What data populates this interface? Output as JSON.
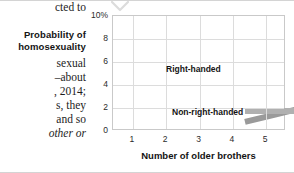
{
  "page": {
    "body_column_lines": [
      {
        "text": "cted  to",
        "top": 1,
        "style": "serif"
      },
      {
        "text": "sexual",
        "top": 57,
        "style": "serif"
      },
      {
        "text": "–about",
        "top": 71,
        "style": "serif"
      },
      {
        "text": ", 2014;",
        "top": 85,
        "style": "serif"
      },
      {
        "text": "s, they",
        "top": 99,
        "style": "serif"
      },
      {
        "text": "and so",
        "top": 113,
        "style": "serif"
      },
      {
        "text": "other or",
        "top": 127,
        "style": "serif-italic"
      }
    ],
    "caption": {
      "line1": "Probability of",
      "line1_top": 29,
      "line2": "homosexuality",
      "line2_top": 41
    },
    "ornament": {
      "icon": "chevron-down-icon",
      "color": "#d9d9d9"
    }
  },
  "chart_data": {
    "type": "line",
    "title": "",
    "subtitle": "",
    "xlabel": "Number of older brothers",
    "ylabel": "Probability of homosexuality",
    "x": [
      1,
      2,
      3,
      4,
      5
    ],
    "xticklabels": [
      "1",
      "2",
      "3",
      "4",
      "5"
    ],
    "yticklabels": [
      "10%",
      "8",
      "6",
      "4",
      "2",
      "0"
    ],
    "yticks": [
      10,
      8,
      6,
      4,
      2,
      0
    ],
    "xlim": [
      0.4,
      5.6
    ],
    "ylim": [
      0,
      10
    ],
    "grid": true,
    "legend_position": "inline-annotations",
    "series": [
      {
        "name": "Right-handed",
        "values": [
          2.1,
          2.8,
          3.5,
          4.4,
          5.5
        ],
        "color": "#9a9a9a",
        "band_width": 0.42,
        "label_x": 166,
        "label_y": 64
      },
      {
        "name": "Non-right-handed",
        "values": [
          3.05,
          3.05,
          3.05,
          3.05,
          3.05
        ],
        "color": "#b0b0b0",
        "band_width": 0.32,
        "label_x": 172,
        "label_y": 107
      }
    ],
    "annotations": [
      {
        "text": "Right-handed",
        "series": "Right-handed"
      },
      {
        "text": "Non-right-handed",
        "series": "Non-right-handed"
      }
    ],
    "axis_color": "#c9c9c9",
    "grid_color": "#dcdcdc"
  }
}
